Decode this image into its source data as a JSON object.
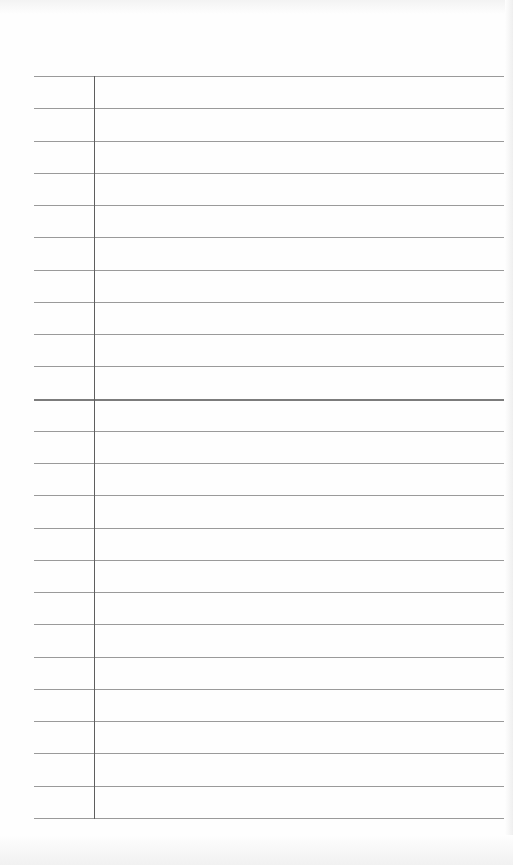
{
  "page": {
    "type": "lined-paper",
    "background": "#fefefe",
    "rule_color": "#9a9a9a",
    "margin_color": "#5e5e5e",
    "rule_count": 24,
    "first_rule_y": 76,
    "rule_spacing": 32.26,
    "rule_left": 34,
    "rule_right": 504,
    "margin_x": 94,
    "emphasized_rule_index": 10,
    "text": []
  }
}
